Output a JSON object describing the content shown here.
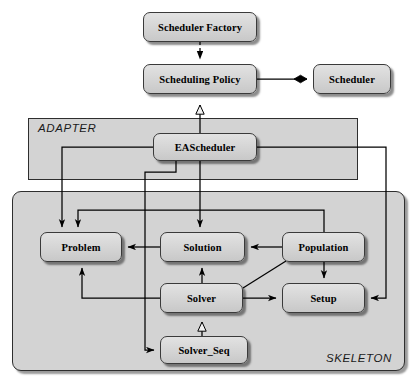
{
  "diagram": {
    "canvas": {
      "width": 418,
      "height": 385
    },
    "packages": [
      {
        "id": "adapter",
        "label": "ADAPTER",
        "x": 28,
        "y": 118,
        "w": 330,
        "h": 62,
        "rounded": false
      },
      {
        "id": "skeleton",
        "label": "SKELETON",
        "x": 12,
        "y": 191,
        "w": 393,
        "h": 180,
        "rounded": true
      }
    ],
    "nodes": [
      {
        "id": "scheduler_factory",
        "label": "Scheduler Factory",
        "x": 143,
        "y": 12,
        "w": 114,
        "h": 30
      },
      {
        "id": "scheduling_policy",
        "label": "Scheduling Policy",
        "x": 143,
        "y": 64,
        "w": 114,
        "h": 30
      },
      {
        "id": "scheduler",
        "label": "Scheduler",
        "x": 313,
        "y": 64,
        "w": 78,
        "h": 30
      },
      {
        "id": "eascheduler",
        "label": "EAScheduler",
        "x": 153,
        "y": 133,
        "w": 104,
        "h": 28
      },
      {
        "id": "problem",
        "label": "Problem",
        "x": 40,
        "y": 232,
        "w": 82,
        "h": 30
      },
      {
        "id": "solution",
        "label": "Solution",
        "x": 160,
        "y": 232,
        "w": 85,
        "h": 30
      },
      {
        "id": "population",
        "label": "Population",
        "x": 282,
        "y": 232,
        "w": 83,
        "h": 30
      },
      {
        "id": "solver",
        "label": "Solver",
        "x": 160,
        "y": 283,
        "w": 83,
        "h": 30
      },
      {
        "id": "setup",
        "label": "Setup",
        "x": 282,
        "y": 283,
        "w": 83,
        "h": 30
      },
      {
        "id": "solver_seq",
        "label": "Solver_Seq",
        "x": 160,
        "y": 336,
        "w": 88,
        "h": 28
      }
    ],
    "edges": [
      {
        "id": "factory-to-policy",
        "from": "scheduler_factory",
        "to": "scheduling_policy",
        "kind": "dependency",
        "arrow": "solid-filled"
      },
      {
        "id": "policy-to-scheduler",
        "from": "scheduling_policy",
        "to": "scheduler",
        "kind": "composition",
        "arrow": "filled-diamond"
      },
      {
        "id": "eascheduler-to-policy",
        "from": "eascheduler",
        "to": "scheduling_policy",
        "kind": "generalization",
        "arrow": "hollow-triangle"
      },
      {
        "id": "eascheduler-to-problem",
        "from": "eascheduler",
        "to": "problem",
        "kind": "association",
        "arrow": "open"
      },
      {
        "id": "eascheduler-to-solution",
        "from": "eascheduler",
        "to": "solution",
        "kind": "association",
        "arrow": "open"
      },
      {
        "id": "eascheduler-to-solverseq",
        "from": "eascheduler",
        "to": "solver_seq",
        "kind": "association",
        "arrow": "open"
      },
      {
        "id": "eascheduler-to-setup",
        "from": "eascheduler",
        "to": "setup",
        "kind": "association",
        "arrow": "open"
      },
      {
        "id": "solution-to-problem",
        "from": "solution",
        "to": "problem",
        "kind": "association",
        "arrow": "open"
      },
      {
        "id": "population-to-solution",
        "from": "population",
        "to": "solution",
        "kind": "association",
        "arrow": "open"
      },
      {
        "id": "population-to-problem",
        "from": "population",
        "to": "problem",
        "kind": "association",
        "arrow": "open"
      },
      {
        "id": "population-to-setup",
        "from": "population",
        "to": "setup",
        "kind": "association",
        "arrow": "open"
      },
      {
        "id": "solver-to-solution",
        "from": "solver",
        "to": "solution",
        "kind": "association",
        "arrow": "open"
      },
      {
        "id": "solver-to-problem",
        "from": "solver",
        "to": "problem",
        "kind": "association",
        "arrow": "open"
      },
      {
        "id": "solver-to-setup",
        "from": "solver",
        "to": "setup",
        "kind": "association",
        "arrow": "open"
      },
      {
        "id": "solver-to-population",
        "from": "solver",
        "to": "population",
        "kind": "association",
        "arrow": "none"
      },
      {
        "id": "solverseq-to-solver",
        "from": "solver_seq",
        "to": "solver",
        "kind": "generalization",
        "arrow": "hollow-triangle"
      }
    ],
    "colors": {
      "node_fill": "#d6d6d6",
      "package_fill": "#d3d3d3",
      "line": "#000000",
      "text": "#000000",
      "background": "#ffffff"
    }
  }
}
